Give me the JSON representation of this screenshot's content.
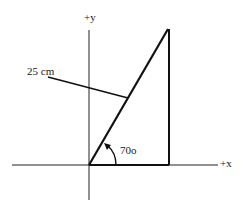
{
  "diagram": {
    "type": "vector-resolution-right-triangle",
    "axes": {
      "x_label": "+x",
      "y_label": "+y"
    },
    "vector": {
      "magnitude_label": "25 cm",
      "angle_label": "70o",
      "angle_degrees": 70
    },
    "colors": {
      "stroke": "#111111",
      "background": "#ffffff"
    }
  }
}
